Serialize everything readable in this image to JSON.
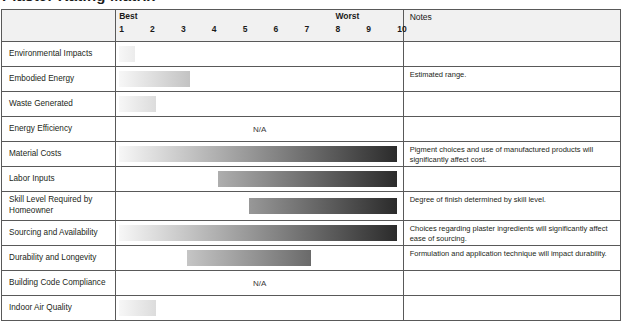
{
  "title": "Plaster Rating Matrix",
  "table": {
    "scale_header": {
      "best_label": "Best",
      "worst_label": "Worst",
      "ticks": [
        "1",
        "2",
        "3",
        "4",
        "5",
        "6",
        "7",
        "8",
        "9",
        "10"
      ]
    },
    "notes_header": "Notes",
    "na_text": "N/A",
    "gradient_light": "#f7f7f7",
    "gradient_dark": "#2b2b2b",
    "rows": [
      {
        "label": "Environmental Impacts",
        "rating_type": "bar",
        "start": 1,
        "end": 1.5,
        "note": ""
      },
      {
        "label": "Embodied Energy",
        "rating_type": "bar",
        "start": 1,
        "end": 3.3,
        "note": "Estimated range."
      },
      {
        "label": "Waste Generated",
        "rating_type": "bar",
        "start": 1,
        "end": 2.2,
        "note": ""
      },
      {
        "label": "Energy Efficiency",
        "rating_type": "na",
        "start": null,
        "end": null,
        "note": ""
      },
      {
        "label": "Material Costs",
        "rating_type": "bar",
        "start": 1,
        "end": 10,
        "note": "Pigment choices and use of manufactured products will significantly affect cost."
      },
      {
        "label": "Labor Inputs",
        "rating_type": "bar",
        "start": 4.2,
        "end": 10,
        "note": ""
      },
      {
        "label": "Skill Level Required by Homeowner",
        "rating_type": "bar",
        "start": 5.2,
        "end": 10,
        "note": "Degree of finish determined by skill level."
      },
      {
        "label": "Sourcing and Availability",
        "rating_type": "bar",
        "start": 1,
        "end": 10,
        "note": "Choices regarding plaster ingredients will significantly affect ease of sourcing."
      },
      {
        "label": "Durability and Longevity",
        "rating_type": "bar",
        "start": 3.2,
        "end": 7.2,
        "note": "Formulation and application technique will impact durability."
      },
      {
        "label": "Building Code Compliance",
        "rating_type": "na",
        "start": null,
        "end": null,
        "note": ""
      },
      {
        "label": "Indoor Air Quality",
        "rating_type": "bar",
        "start": 1,
        "end": 2.2,
        "note": ""
      }
    ]
  }
}
